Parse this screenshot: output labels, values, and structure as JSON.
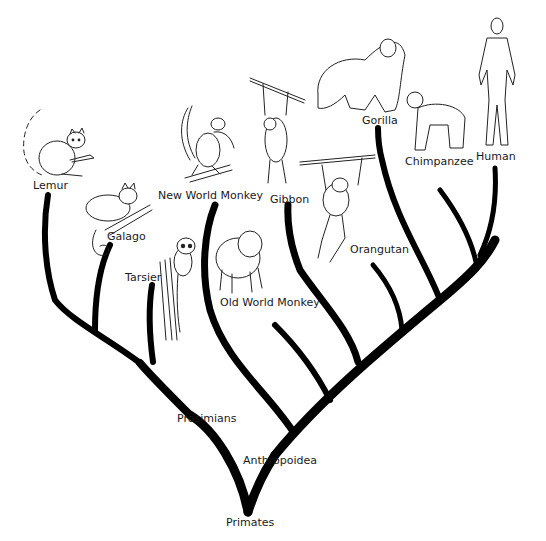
{
  "diagram": {
    "type": "phylogenetic-tree",
    "root": "Primates",
    "clades": [
      {
        "name": "Prosimians",
        "members": [
          "Lemur",
          "Galago",
          "Tarsier"
        ]
      },
      {
        "name": "Anthropoidea",
        "members": [
          "New World Monkey",
          "Old World Monkey",
          "Gibbon",
          "Orangutan",
          "Gorilla",
          "Chimpanzee",
          "Human"
        ]
      }
    ],
    "labels": {
      "primates": "Primates",
      "prosimians": "Prosimians",
      "anthropoidea": "Anthropoidea",
      "lemur": "Lemur",
      "galago": "Galago",
      "tarsier": "Tarsier",
      "new_world_monkey": "New World Monkey",
      "old_world_monkey": "Old World Monkey",
      "gibbon": "Gibbon",
      "orangutan": "Orangutan",
      "gorilla": "Gorilla",
      "chimpanzee": "Chimpanzee",
      "human": "Human"
    },
    "illustrations": [
      "lemur",
      "galago",
      "tarsier",
      "new-world-monkey",
      "old-world-monkey",
      "gibbon",
      "orangutan",
      "gorilla",
      "chimpanzee",
      "human"
    ]
  }
}
